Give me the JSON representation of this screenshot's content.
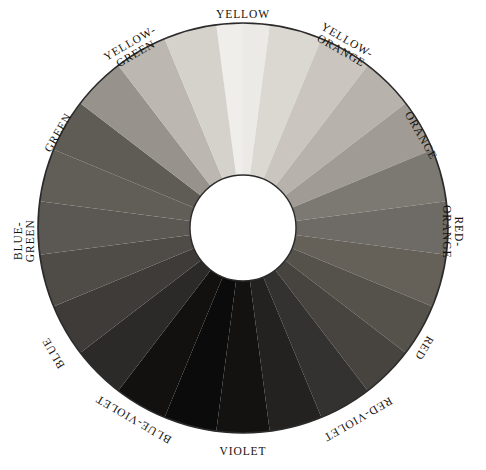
{
  "figure": {
    "name": "color-wheel",
    "background": "#ffffff",
    "outline_color": "#2b2b2b",
    "hub_color": "#ffffff",
    "center": {
      "x": 243,
      "y": 228
    },
    "outer_radius": 205,
    "inner_radius": 53
  },
  "chart_data": {
    "type": "pie",
    "xlabel": "",
    "ylabel": "",
    "legend_position": "around-ring",
    "grid": false,
    "segment_count": 24,
    "segment_span_degrees": 15,
    "categories": [
      "YELLOW",
      "YELLOW-ORANGE",
      "ORANGE",
      "RED-ORANGE",
      "RED",
      "RED-VIOLET",
      "VIOLET",
      "BLUE-VIOLET",
      "BLUE",
      "BLUE-GREEN",
      "GREEN",
      "YELLOW-GREEN"
    ],
    "values": [
      1,
      1,
      1,
      1,
      1,
      1,
      1,
      1,
      1,
      1,
      1,
      1
    ],
    "series": [
      {
        "name": "gray-value",
        "values": [
          242,
          208,
          170,
          128,
          96,
          62,
          26,
          30,
          74,
          118,
          120,
          196
        ]
      }
    ],
    "segments": [
      {
        "index": 0,
        "hue": "YELLOW",
        "half": "a",
        "start_deg": -7.5,
        "end_deg": 0,
        "gray": "#f0eeea"
      },
      {
        "index": 1,
        "hue": "YELLOW",
        "half": "b",
        "start_deg": 0,
        "end_deg": 7.5,
        "gray": "#eceae6"
      },
      {
        "index": 2,
        "hue": "YELLOW-ORANGE",
        "half": "a",
        "start_deg": 7.5,
        "end_deg": 22.5,
        "gray": "#dbd8d2"
      },
      {
        "index": 3,
        "hue": "YELLOW-ORANGE",
        "half": "b",
        "start_deg": 22.5,
        "end_deg": 37.5,
        "gray": "#cac6bf"
      },
      {
        "index": 4,
        "hue": "ORANGE",
        "half": "a",
        "start_deg": 37.5,
        "end_deg": 52.5,
        "gray": "#b7b3ac"
      },
      {
        "index": 5,
        "hue": "ORANGE",
        "half": "b",
        "start_deg": 52.5,
        "end_deg": 67.5,
        "gray": "#a09b94"
      },
      {
        "index": 6,
        "hue": "RED-ORANGE",
        "half": "a",
        "start_deg": 67.5,
        "end_deg": 82.5,
        "gray": "#7c7872"
      },
      {
        "index": 7,
        "hue": "RED-ORANGE",
        "half": "b",
        "start_deg": 82.5,
        "end_deg": 97.5,
        "gray": "#6e6a65"
      },
      {
        "index": 8,
        "hue": "RED",
        "half": "a",
        "start_deg": 97.5,
        "end_deg": 112.5,
        "gray": "#656159"
      },
      {
        "index": 9,
        "hue": "RED",
        "half": "b",
        "start_deg": 112.5,
        "end_deg": 127.5,
        "gray": "#55514b"
      },
      {
        "index": 10,
        "hue": "RED-VIOLET",
        "half": "a",
        "start_deg": 127.5,
        "end_deg": 142.5,
        "gray": "#474440"
      },
      {
        "index": 11,
        "hue": "RED-VIOLET",
        "half": "b",
        "start_deg": 142.5,
        "end_deg": 157.5,
        "gray": "#343230"
      },
      {
        "index": 12,
        "hue": "VIOLET",
        "half": "a",
        "start_deg": 157.5,
        "end_deg": 172.5,
        "gray": "#242221"
      },
      {
        "index": 13,
        "hue": "VIOLET",
        "half": "b",
        "start_deg": 172.5,
        "end_deg": 187.5,
        "gray": "#131211"
      },
      {
        "index": 14,
        "hue": "BLUE-VIOLET",
        "half": "a",
        "start_deg": 187.5,
        "end_deg": 202.5,
        "gray": "#0c0b0b"
      },
      {
        "index": 15,
        "hue": "BLUE-VIOLET",
        "half": "b",
        "start_deg": 202.5,
        "end_deg": 217.5,
        "gray": "#121110"
      },
      {
        "index": 16,
        "hue": "BLUE",
        "half": "a",
        "start_deg": 217.5,
        "end_deg": 232.5,
        "gray": "#2c2a28"
      },
      {
        "index": 17,
        "hue": "BLUE",
        "half": "b",
        "start_deg": 232.5,
        "end_deg": 247.5,
        "gray": "#3e3b38"
      },
      {
        "index": 18,
        "hue": "BLUE-GREEN",
        "half": "a",
        "start_deg": 247.5,
        "end_deg": 262.5,
        "gray": "#4f4c48"
      },
      {
        "index": 19,
        "hue": "BLUE-GREEN",
        "half": "b",
        "start_deg": 262.5,
        "end_deg": 277.5,
        "gray": "#5b5752"
      },
      {
        "index": 20,
        "hue": "GREEN",
        "half": "a",
        "start_deg": 277.5,
        "end_deg": 292.5,
        "gray": "#615d57"
      },
      {
        "index": 21,
        "hue": "GREEN",
        "half": "b",
        "start_deg": 292.5,
        "end_deg": 307.5,
        "gray": "#5f5b55"
      },
      {
        "index": 22,
        "hue": "YELLOW-GREEN",
        "half": "a",
        "start_deg": 307.5,
        "end_deg": 322.5,
        "gray": "#97938c"
      },
      {
        "index": 23,
        "hue": "YELLOW-GREEN",
        "half": "b",
        "start_deg": 322.5,
        "end_deg": 337.5,
        "gray": "#bcb8b1"
      },
      {
        "index": 24,
        "hue": "YELLOW-GREEN",
        "half": "c",
        "start_deg": 337.5,
        "end_deg": 352.5,
        "gray": "#d5d2cc"
      }
    ]
  },
  "labels": [
    {
      "id": "yellow",
      "text": "YELLOW",
      "lines": [
        "YELLOW"
      ],
      "angle_deg": 0,
      "rotation": 0,
      "x": 243,
      "y": 15,
      "align": "center"
    },
    {
      "id": "yellow-orange",
      "text": "YELLOW-ORANGE",
      "lines": [
        "YELLOW-",
        "ORANGE"
      ],
      "angle_deg": 30,
      "rotation": 30,
      "x": 344,
      "y": 45,
      "align": "center"
    },
    {
      "id": "orange",
      "text": "ORANGE",
      "lines": [
        "ORANGE"
      ],
      "angle_deg": 60,
      "rotation": 60,
      "x": 420,
      "y": 136,
      "align": "center"
    },
    {
      "id": "red-orange",
      "text": "RED-ORANGE",
      "lines": [
        "RED-",
        "ORANGE"
      ],
      "angle_deg": 90,
      "rotation": 90,
      "x": 452,
      "y": 231,
      "align": "center"
    },
    {
      "id": "red",
      "text": "RED",
      "lines": [
        "RED"
      ],
      "angle_deg": 120,
      "rotation": 120,
      "x": 424,
      "y": 348,
      "align": "center"
    },
    {
      "id": "red-violet",
      "text": "RED-VIOLET",
      "lines": [
        "RED-VIOLET"
      ],
      "angle_deg": 150,
      "rotation": 150,
      "x": 357,
      "y": 419,
      "align": "center"
    },
    {
      "id": "violet",
      "text": "VIOLET",
      "lines": [
        "VIOLET"
      ],
      "angle_deg": 180,
      "rotation": 0,
      "x": 243,
      "y": 452,
      "align": "center"
    },
    {
      "id": "blue-violet",
      "text": "BLUE-VIOLET",
      "lines": [
        "BLUE-VIOLET"
      ],
      "angle_deg": 210,
      "rotation": -150,
      "x": 133,
      "y": 419,
      "align": "center"
    },
    {
      "id": "blue",
      "text": "BLUE",
      "lines": [
        "BLUE"
      ],
      "angle_deg": 240,
      "rotation": -120,
      "x": 54,
      "y": 353,
      "align": "center"
    },
    {
      "id": "blue-green",
      "text": "BLUE-GREEN",
      "lines": [
        "BLUE-",
        "GREEN"
      ],
      "angle_deg": 270,
      "rotation": -90,
      "x": 24,
      "y": 240,
      "align": "center"
    },
    {
      "id": "green",
      "text": "GREEN",
      "lines": [
        "GREEN"
      ],
      "angle_deg": 300,
      "rotation": -60,
      "x": 58,
      "y": 133,
      "align": "center"
    },
    {
      "id": "yellow-green",
      "text": "YELLOW-GREEN",
      "lines": [
        "YELLOW-",
        "GREEN"
      ],
      "angle_deg": 330,
      "rotation": -30,
      "x": 133,
      "y": 48,
      "align": "center"
    }
  ]
}
